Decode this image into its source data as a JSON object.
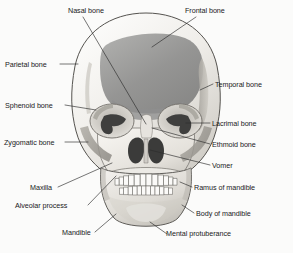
{
  "figure": {
    "view": "anterior",
    "style": "grayscale medical illustration",
    "colors": {
      "background": "#fbfbfa",
      "bone_light": "#f2f0ec",
      "bone_mid": "#d8d5cf",
      "bone_shadow": "#b5b2ab",
      "frontal_dark": "#8a8a8a",
      "cavity_dark": "#3d3d3d",
      "outline": "#4a4a48",
      "leader_line": "#2b2b2b",
      "label_text": "#1a1a1a"
    }
  },
  "labels": [
    {
      "id": "nasal-bone",
      "text": "Nasal bone",
      "side": "top",
      "x": 68,
      "y": 6
    },
    {
      "id": "frontal-bone",
      "text": "Frontal bone",
      "side": "top",
      "x": 185,
      "y": 6
    },
    {
      "id": "parietal-bone",
      "text": "Parietal bone",
      "side": "left",
      "x": 5,
      "y": 60
    },
    {
      "id": "sphenoid-bone",
      "text": "Sphenoid bone",
      "side": "left",
      "x": 5,
      "y": 101
    },
    {
      "id": "zygomatic-bone",
      "text": "Zygomatic bone",
      "side": "left",
      "x": 4,
      "y": 138
    },
    {
      "id": "maxilla",
      "text": "Maxilla",
      "side": "left",
      "x": 30,
      "y": 185
    },
    {
      "id": "alveolar-process",
      "text": "Alveolar process",
      "side": "left",
      "x": 15,
      "y": 203
    },
    {
      "id": "mandible",
      "text": "Mandible",
      "side": "bottom",
      "x": 62,
      "y": 232
    },
    {
      "id": "temporal-bone",
      "text": "Temporal bone",
      "side": "right",
      "x": 215,
      "y": 81
    },
    {
      "id": "lacrimal-bone",
      "text": "Lacrimal bone",
      "side": "right",
      "x": 212,
      "y": 120
    },
    {
      "id": "ethmoid-bone",
      "text": "Ethmoid bone",
      "side": "right",
      "x": 212,
      "y": 141
    },
    {
      "id": "vomer",
      "text": "Vomer",
      "side": "right",
      "x": 212,
      "y": 162
    },
    {
      "id": "ramus-of-mandible",
      "text": "Ramus of mandible",
      "side": "right",
      "x": 194,
      "y": 185
    },
    {
      "id": "body-of-mandible",
      "text": "Body of mandible",
      "side": "right",
      "x": 196,
      "y": 211
    },
    {
      "id": "mental-protuberance",
      "text": "Mental protuberance",
      "side": "bottom",
      "x": 169,
      "y": 233
    }
  ],
  "structures": [
    {
      "id": "cranium",
      "name": "cranial vault"
    },
    {
      "id": "frontal-bone-area",
      "name": "frontal bone shaded region"
    },
    {
      "id": "orbit-left",
      "name": "left orbital cavity"
    },
    {
      "id": "orbit-right",
      "name": "right orbital cavity"
    },
    {
      "id": "nasal-aperture",
      "name": "piriform nasal aperture"
    },
    {
      "id": "vomer-septum",
      "name": "nasal septum / vomer"
    },
    {
      "id": "maxilla-body",
      "name": "maxilla"
    },
    {
      "id": "upper-teeth",
      "name": "upper dental arch"
    },
    {
      "id": "lower-teeth",
      "name": "lower dental arch"
    },
    {
      "id": "mandible-body",
      "name": "mandible"
    },
    {
      "id": "zygomatic-left",
      "name": "left zygomatic arch"
    },
    {
      "id": "zygomatic-right",
      "name": "right zygomatic arch"
    },
    {
      "id": "temporal-strip",
      "name": "temporal bone strip"
    }
  ]
}
